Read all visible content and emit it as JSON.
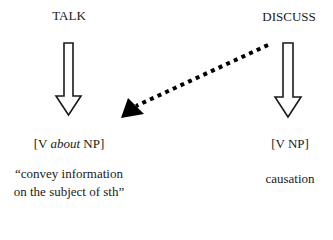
{
  "diagram": {
    "left_column": {
      "verb": "TALK",
      "pattern": {
        "prefix": "[V ",
        "italic": "about",
        "suffix": " NP]"
      },
      "meaning_lines": [
        "“convey information",
        "on the subject of sth”"
      ]
    },
    "right_column": {
      "verb": "DISCUSS",
      "pattern": "[V NP]",
      "meaning": "causation"
    },
    "arrows": [
      {
        "from": "TALK",
        "to": "[V about NP]",
        "style": "hollow-block"
      },
      {
        "from": "DISCUSS",
        "to": "[V NP]",
        "style": "hollow-block"
      },
      {
        "from": "DISCUSS",
        "to": "[V about NP]",
        "style": "dotted-filled-head"
      }
    ],
    "colors": {
      "ink": "#1a1a1a",
      "background": "#ffffff"
    }
  }
}
